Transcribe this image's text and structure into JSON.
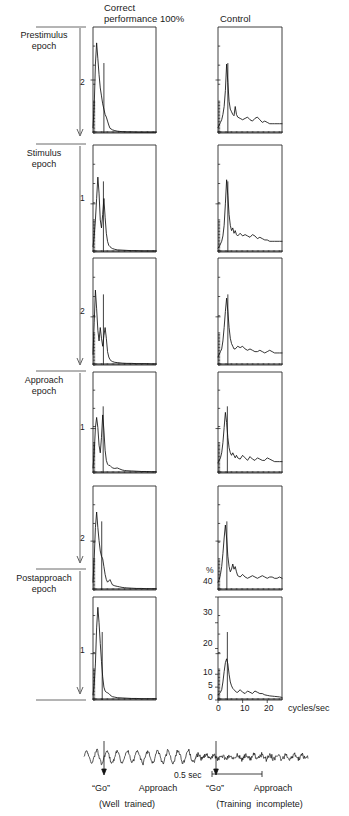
{
  "figure": {
    "titles": {
      "left_line1": "Correct",
      "left_line2": "performance 100%",
      "right": "Control"
    },
    "epoch_labels": [
      {
        "line1": "Prestimulus",
        "line2": "epoch"
      },
      {
        "line1": "Stimulus",
        "line2": "epoch"
      },
      {
        "line1": "Approach",
        "line2": "epoch"
      },
      {
        "line1": "Postapproach",
        "line2": "epoch"
      }
    ],
    "row_scale_labels": [
      "2",
      "1",
      "2",
      "1",
      "2",
      "1"
    ],
    "percent_symbol": "%",
    "y_axis": {
      "label": "%",
      "ticks": [
        "40",
        "30",
        "20",
        "10",
        "5",
        "0"
      ],
      "values": [
        40,
        30,
        20,
        10,
        5,
        0
      ],
      "range": [
        0,
        40
      ]
    },
    "x_axis": {
      "label": "cycles/sec",
      "ticks": [
        "0",
        "10",
        "20"
      ],
      "values": [
        0,
        10,
        20
      ],
      "range": [
        0,
        26
      ]
    },
    "bottom": {
      "scalebar_label": "0.5 sec",
      "left": {
        "go": "“Go”",
        "approach": "Approach",
        "note": "(Well  trained)"
      },
      "right": {
        "go": "“Go”",
        "approach": "Approach",
        "note": "(Training  incomplete)"
      }
    }
  },
  "chart_data": {
    "type": "line",
    "xlabel": "cycles/sec",
    "ylabel": "%",
    "xlim": [
      0,
      26
    ],
    "ylim": [
      0,
      40
    ],
    "grid": false,
    "legend": "none",
    "x_ticks": [
      0,
      10,
      20
    ],
    "y_ticks": [
      0,
      5,
      10,
      20,
      30,
      40
    ],
    "panel_rows": [
      {
        "epoch": "Prestimulus epoch",
        "row": 1,
        "scale_tick": 2,
        "marker_x": 4.5
      },
      {
        "epoch": "Prestimulus epoch",
        "row": 1,
        "scale_tick": 2,
        "marker_x": 4.0
      },
      {
        "epoch": "Stimulus epoch",
        "row": 2,
        "scale_tick": 1,
        "marker_x": 4.3
      },
      {
        "epoch": "Stimulus epoch",
        "row": 3,
        "scale_tick": 2,
        "marker_x": 4.3
      },
      {
        "epoch": "Approach epoch",
        "row": 4,
        "scale_tick": 1,
        "marker_x": 4.2
      },
      {
        "epoch": "Approach epoch",
        "row": 5,
        "scale_tick": 2,
        "marker_x": 3.6
      },
      {
        "epoch": "Postapproach epoch",
        "row": 6,
        "scale_tick": 1,
        "marker_x": 3.8
      }
    ],
    "series": [
      {
        "name": "correct-row1",
        "column": "Correct performance 100%",
        "row": 1,
        "x": [
          0,
          0.5,
          1,
          1.5,
          2,
          2.5,
          3,
          3.5,
          4,
          4.5,
          5,
          5.5,
          6,
          6.5,
          7,
          8,
          9,
          10,
          11,
          12,
          13,
          14,
          16,
          18,
          20,
          22,
          24,
          26
        ],
        "y": [
          2,
          10,
          26,
          34,
          28,
          22,
          17,
          14,
          11,
          9,
          7,
          6,
          4.5,
          3,
          1.8,
          1.2,
          0.9,
          0.7,
          0.6,
          0.5,
          0.5,
          0.4,
          0.4,
          0.3,
          0.3,
          0.3,
          0.3,
          0.3
        ]
      },
      {
        "name": "control-row1",
        "column": "Control",
        "row": 1,
        "x": [
          0,
          0.5,
          1,
          1.5,
          2,
          2.5,
          3,
          3.5,
          4,
          4.5,
          5,
          5.5,
          6,
          6.5,
          7,
          7.5,
          8,
          9,
          10,
          11,
          12,
          13,
          14,
          15,
          16,
          17,
          18,
          19,
          20,
          21,
          22,
          23,
          24,
          25,
          26
        ],
        "y": [
          2,
          3,
          4,
          5,
          7,
          10,
          16,
          26,
          19,
          12,
          9,
          8,
          7,
          6.5,
          10,
          7,
          6,
          5.5,
          5,
          5.5,
          6,
          5,
          4.5,
          5.5,
          6,
          5,
          4,
          4.5,
          4,
          3.5,
          3.5,
          3.5,
          3.5,
          3.5,
          3.5
        ]
      },
      {
        "name": "correct-row2",
        "column": "Correct performance 100%",
        "row": 2,
        "x": [
          0,
          0.5,
          1,
          1.5,
          2,
          2.5,
          3,
          3.5,
          4,
          4.5,
          5,
          5.5,
          6,
          6.5,
          7,
          7.5,
          8,
          9,
          10,
          12,
          14,
          16,
          18,
          20,
          22,
          24,
          26
        ],
        "y": [
          2,
          6,
          12,
          20,
          28,
          22,
          12,
          9,
          14,
          20,
          13,
          7,
          4,
          2.5,
          2,
          1.6,
          1.3,
          1,
          0.8,
          0.7,
          0.6,
          0.5,
          0.5,
          0.4,
          0.4,
          0.4,
          0.4
        ]
      },
      {
        "name": "control-row2",
        "column": "Control",
        "row": 2,
        "x": [
          0,
          0.5,
          1,
          1.5,
          2,
          2.5,
          3,
          3.5,
          4,
          4.5,
          5,
          5.5,
          6,
          6.5,
          7,
          7.5,
          8,
          9,
          10,
          11,
          12,
          13,
          14,
          15,
          16,
          17,
          18,
          19,
          20,
          21,
          22,
          23,
          24,
          25,
          26
        ],
        "y": [
          1.5,
          2,
          3,
          4,
          6,
          10,
          18,
          27,
          21,
          14,
          10,
          8,
          9,
          7,
          8,
          6.5,
          6,
          7,
          6,
          6.5,
          6,
          5.5,
          6.5,
          6,
          5,
          5.5,
          5,
          4.5,
          4.5,
          4,
          4,
          4,
          4,
          4,
          4
        ]
      },
      {
        "name": "correct-row3",
        "column": "Correct performance 100%",
        "row": 3,
        "x": [
          0,
          0.5,
          1,
          1.5,
          2,
          2.5,
          3,
          3.5,
          4,
          4.5,
          5,
          5.5,
          6,
          6.5,
          7,
          7.5,
          8,
          9,
          10,
          12,
          14,
          16,
          18,
          20,
          22,
          24,
          26
        ],
        "y": [
          4,
          16,
          28,
          21,
          13,
          9,
          14,
          10,
          7,
          11,
          14,
          10,
          5,
          3,
          2,
          1.6,
          1.3,
          1,
          0.9,
          0.7,
          0.6,
          0.6,
          0.5,
          0.5,
          0.5,
          0.4,
          0.4
        ]
      },
      {
        "name": "control-row3",
        "column": "Control",
        "row": 3,
        "x": [
          0,
          0.5,
          1,
          1.5,
          2,
          2.5,
          3,
          3.5,
          4,
          4.5,
          5,
          5.5,
          6,
          6.5,
          7,
          8,
          9,
          10,
          11,
          12,
          13,
          14,
          15,
          16,
          17,
          18,
          19,
          20,
          21,
          22,
          23,
          24,
          25,
          26
        ],
        "y": [
          3,
          4,
          5,
          6,
          9,
          14,
          20,
          25,
          20,
          14,
          10,
          8,
          7,
          6,
          6,
          7,
          6.5,
          7,
          6,
          5.5,
          6,
          5.5,
          5,
          5,
          5.5,
          5,
          4.5,
          5,
          5.5,
          5,
          4.5,
          4.5,
          4.5,
          4.5
        ]
      },
      {
        "name": "correct-row4",
        "column": "Correct performance 100%",
        "row": 4,
        "x": [
          0,
          0.5,
          1,
          1.5,
          2,
          2.5,
          3,
          3.5,
          4,
          4.5,
          5,
          5.5,
          6,
          6.5,
          7,
          7.5,
          8,
          9,
          10,
          11,
          12,
          13,
          14,
          16,
          18,
          20,
          22,
          24,
          26
        ],
        "y": [
          2,
          8,
          18,
          22,
          18,
          11,
          8,
          14,
          23,
          17,
          9,
          5,
          3.5,
          3,
          3,
          2.5,
          2,
          1.8,
          2,
          1.6,
          1.2,
          1,
          0.9,
          0.8,
          0.7,
          0.6,
          0.6,
          0.5,
          0.5
        ]
      },
      {
        "name": "control-row4",
        "column": "Control",
        "row": 4,
        "x": [
          0,
          0.5,
          1,
          1.5,
          2,
          2.5,
          3,
          3.5,
          4,
          4.5,
          5,
          5.5,
          6,
          6.5,
          7,
          7.5,
          8,
          9,
          10,
          11,
          12,
          13,
          14,
          15,
          16,
          17,
          18,
          19,
          20,
          21,
          22,
          23,
          24,
          25,
          26
        ],
        "y": [
          4,
          5,
          6,
          8,
          12,
          18,
          24,
          20,
          14,
          10,
          8,
          7,
          8,
          7,
          6,
          7,
          6,
          5.5,
          7,
          6,
          5,
          6.5,
          5.5,
          5,
          6,
          5.5,
          5,
          5,
          6,
          5.5,
          5,
          4.5,
          4.5,
          4.5,
          4.5
        ]
      },
      {
        "name": "correct-row5",
        "column": "Correct performance 100%",
        "row": 5,
        "x": [
          0,
          0.5,
          1,
          1.5,
          2,
          2.5,
          3,
          3.5,
          4,
          4.5,
          5,
          5.5,
          6,
          6.5,
          7,
          7.5,
          8,
          9,
          10,
          11,
          12,
          13,
          14,
          16,
          18,
          20,
          22,
          24,
          26
        ],
        "y": [
          3,
          12,
          24,
          30,
          24,
          19,
          15,
          13,
          12,
          9,
          6,
          4,
          3,
          3.5,
          4,
          3,
          2,
          1.6,
          1.4,
          1.2,
          1,
          0.9,
          0.8,
          0.7,
          0.6,
          0.6,
          0.5,
          0.5,
          0.5
        ]
      },
      {
        "name": "control-row5",
        "column": "Control",
        "row": 5,
        "x": [
          0,
          0.5,
          1,
          1.5,
          2,
          2.5,
          3,
          3.5,
          4,
          4.5,
          5,
          5.5,
          6,
          6.5,
          7,
          7.5,
          8,
          9,
          10,
          11,
          12,
          13,
          14,
          15,
          16,
          17,
          18,
          19,
          20,
          21,
          22,
          23,
          24,
          25,
          26
        ],
        "y": [
          3,
          4,
          6,
          9,
          14,
          20,
          25,
          20,
          13,
          9,
          7,
          8,
          10,
          8,
          9,
          7,
          5.5,
          5,
          6,
          5,
          4.5,
          5,
          5.5,
          5,
          4.5,
          5,
          5.5,
          5,
          4.5,
          5,
          5,
          4.5,
          4.5,
          5,
          4.5
        ]
      },
      {
        "name": "correct-row6",
        "column": "Correct performance 100%",
        "row": 6,
        "x": [
          0,
          0.5,
          1,
          1.5,
          2,
          2.5,
          3,
          3.5,
          4,
          4.5,
          5,
          5.5,
          6,
          6.5,
          7,
          7.5,
          8,
          9,
          10,
          12,
          14,
          16,
          18,
          20,
          22,
          24,
          26
        ],
        "y": [
          2,
          6,
          14,
          28,
          36,
          30,
          22,
          15,
          9,
          5,
          3.5,
          3,
          2.8,
          2.5,
          2,
          1.6,
          1.3,
          1.1,
          0.9,
          0.8,
          0.7,
          0.6,
          0.6,
          0.5,
          0.5,
          0.5,
          0.5
        ]
      },
      {
        "name": "control-row6",
        "column": "Control",
        "row": 6,
        "x": [
          0,
          0.5,
          1,
          1.5,
          2,
          2.5,
          3,
          3.5,
          4,
          4.5,
          5,
          5.5,
          6,
          6.5,
          7,
          7.5,
          8,
          9,
          10,
          11,
          12,
          13,
          14,
          15,
          16,
          17,
          18,
          19,
          20,
          21,
          22,
          23,
          24,
          25,
          26
        ],
        "y": [
          2,
          2.5,
          3,
          4,
          7,
          11,
          14.5,
          16,
          14,
          10,
          7,
          5.5,
          4.5,
          4,
          3.5,
          3,
          3,
          4,
          3,
          2.5,
          3.5,
          3,
          2.5,
          3.5,
          3,
          2.5,
          2.5,
          2,
          1.8,
          1.6,
          1.5,
          1.4,
          1.3,
          1.2,
          1
        ]
      }
    ]
  }
}
